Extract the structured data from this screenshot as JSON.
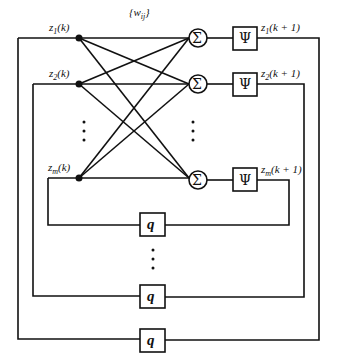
{
  "diagram": {
    "weights_label": "{w_ij}",
    "inputs": [
      {
        "label": "z",
        "sub": "1",
        "arg": "(k)"
      },
      {
        "label": "z",
        "sub": "2",
        "arg": "(k)"
      },
      {
        "label": "z",
        "sub": "m",
        "arg": "(k)"
      }
    ],
    "summers": [
      {
        "symbol": "Σ"
      },
      {
        "symbol": "Σ"
      },
      {
        "symbol": "Σ"
      }
    ],
    "activations": [
      {
        "symbol": "Ψ"
      },
      {
        "symbol": "Ψ"
      },
      {
        "symbol": "Ψ"
      }
    ],
    "outputs": [
      {
        "label": "z",
        "sub": "1",
        "arg": "(k + 1)"
      },
      {
        "label": "z",
        "sub": "2",
        "arg": "(k + 1)"
      },
      {
        "label": "z",
        "sub": "m",
        "arg": "(k + 1)"
      }
    ],
    "delays": [
      {
        "symbol": "q"
      },
      {
        "symbol": "q"
      },
      {
        "symbol": "q"
      }
    ],
    "ellipsis": "⋮"
  }
}
